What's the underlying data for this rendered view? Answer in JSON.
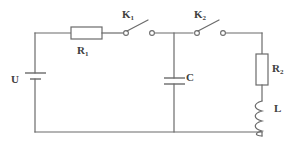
{
  "diagram": {
    "stroke_color": "#6b6b6b",
    "label_color": "#404040",
    "background": "#ffffff",
    "labels": {
      "source": "U",
      "resistor1_name": "R",
      "resistor1_sub": "1",
      "switch1_name": "K",
      "switch1_sub": "1",
      "switch2_name": "K",
      "switch2_sub": "2",
      "capacitor": "C",
      "resistor2_name": "R",
      "resistor2_sub": "2",
      "inductor": "L"
    },
    "components": [
      {
        "id": "U",
        "type": "battery",
        "label": "U",
        "orientation": "vertical",
        "branch": "left"
      },
      {
        "id": "R1",
        "type": "resistor",
        "label": "R1",
        "orientation": "horizontal",
        "branch": "top"
      },
      {
        "id": "K1",
        "type": "switch",
        "label": "K1",
        "state": "open",
        "orientation": "horizontal",
        "branch": "top"
      },
      {
        "id": "K2",
        "type": "switch",
        "label": "K2",
        "state": "open",
        "orientation": "horizontal",
        "branch": "top"
      },
      {
        "id": "C",
        "type": "capacitor",
        "label": "C",
        "orientation": "vertical",
        "branch": "middle"
      },
      {
        "id": "R2",
        "type": "resistor",
        "label": "R2",
        "orientation": "vertical",
        "branch": "right"
      },
      {
        "id": "L",
        "type": "inductor",
        "label": "L",
        "orientation": "vertical",
        "branch": "right",
        "turns": 4
      }
    ]
  }
}
